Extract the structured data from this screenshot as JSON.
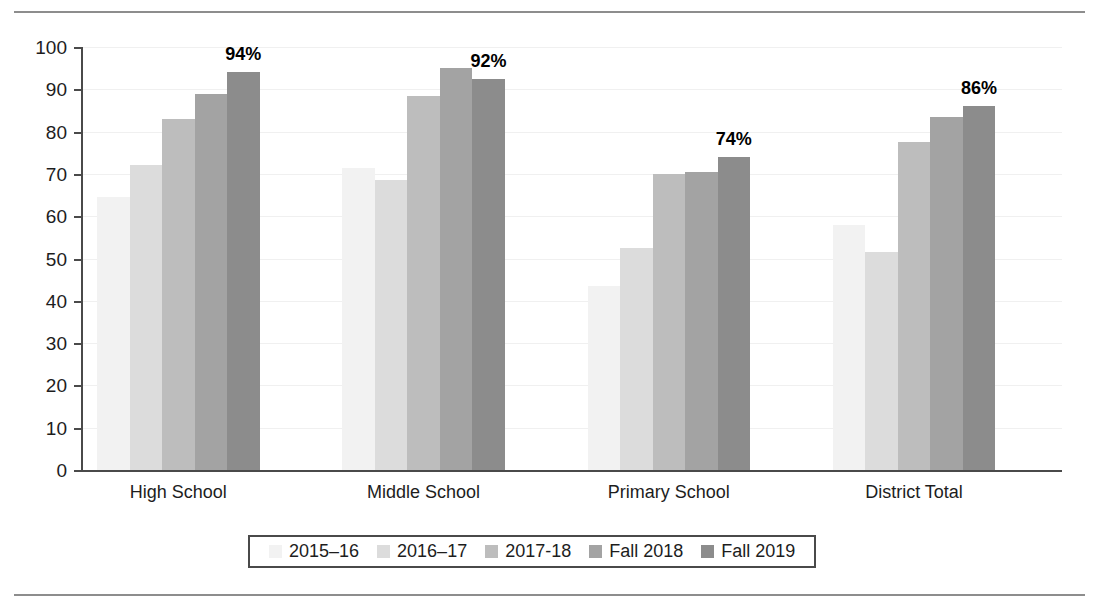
{
  "chart_data": {
    "type": "bar",
    "title": "",
    "subtitle": "",
    "xlabel": "",
    "ylabel": "",
    "ylim": [
      0,
      100
    ],
    "ytick_step": 10,
    "grid": true,
    "legend_position": "bottom",
    "categories": [
      "High School",
      "Middle School",
      "Primary School",
      "District Total"
    ],
    "yticks": [
      "0",
      "10",
      "20",
      "30",
      "40",
      "50",
      "60",
      "70",
      "80",
      "90",
      "100"
    ],
    "series": [
      {
        "name": "2015–16",
        "color": "#f2f2f2",
        "values": [
          64.5,
          71.5,
          43.5,
          58.0
        ]
      },
      {
        "name": "2016–17",
        "color": "#dcdcdc",
        "values": [
          72.0,
          68.5,
          52.5,
          51.5
        ]
      },
      {
        "name": "2017-18",
        "color": "#bdbdbd",
        "values": [
          83.0,
          88.5,
          70.0,
          77.5
        ]
      },
      {
        "name": "Fall 2018",
        "color": "#a3a3a3",
        "values": [
          89.0,
          95.0,
          70.5,
          83.5
        ]
      },
      {
        "name": "Fall 2019",
        "color": "#8c8c8c",
        "values": [
          94.0,
          92.5,
          74.0,
          86.0
        ]
      }
    ],
    "data_labels": [
      {
        "category": "High School",
        "text": "94%"
      },
      {
        "category": "Middle School",
        "text": "92%"
      },
      {
        "category": "Primary School",
        "text": "74%"
      },
      {
        "category": "District Total",
        "text": "86%"
      }
    ]
  },
  "legend": {
    "items": [
      {
        "label": "2015–16"
      },
      {
        "label": "2016–17"
      },
      {
        "label": "2017-18"
      },
      {
        "label": "Fall 2018"
      },
      {
        "label": "Fall 2019"
      }
    ]
  },
  "colors": {
    "axis": "#4a4a4a",
    "grid": "#f0f0f0",
    "rule": "#8d8d8d",
    "text": "#1d1d1d"
  }
}
